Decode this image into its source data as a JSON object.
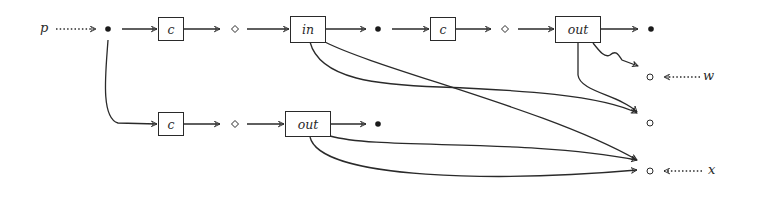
{
  "diagram": {
    "colors": {
      "stroke": "#2a2a2a",
      "background": "#ffffff"
    },
    "inputs": {
      "p": "p",
      "w": "w",
      "x": "x"
    },
    "top_row": {
      "box1": "c",
      "box2": "in",
      "box3": "c",
      "box4": "out"
    },
    "bottom_row": {
      "box1": "c",
      "box2": "out"
    },
    "node_types": {
      "filled": "dot",
      "diamond": "diamond",
      "hollow": "circle"
    }
  }
}
